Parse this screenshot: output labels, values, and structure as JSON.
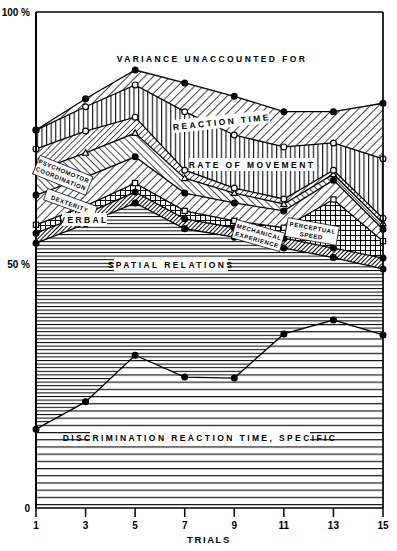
{
  "figure": {
    "x_axis_title": "TRIALS",
    "y_axis_top_label": "100 %",
    "y_axis_mid_label": "50 %",
    "y_axis_zero_label": "0",
    "x_tick_labels": [
      "1",
      "3",
      "5",
      "7",
      "9",
      "11",
      "13",
      "15"
    ]
  },
  "band_labels": {
    "variance_unaccounted": "VARIANCE    UNACCOUNTED    FOR",
    "reaction_time": "REACTION  TIME",
    "rate_of_movement": "RATE  OF  MOVEMENT",
    "psychomotor_coordination_line1": "PSYCHOMOTOR",
    "psychomotor_coordination_line2": "COORDINATION",
    "dexterity": "DEXTERITY",
    "verbal": "VERBAL",
    "spatial_relations": "SPATIAL   RELATIONS",
    "mechanical_line1": "MECHANICAL",
    "mechanical_line2": "EXPERIENCE",
    "perceptual_line1": "PERCEPTUAL",
    "perceptual_line2": "SPEED",
    "discrimination_reaction_time": "DISCRIMINATION   REACTION   TIME,   SPECIFIC"
  },
  "chart_data": {
    "type": "area",
    "title": "",
    "xlabel": "TRIALS",
    "ylabel": "",
    "xlim": [
      1,
      15
    ],
    "ylim": [
      0,
      100
    ],
    "grid": false,
    "legend_position": "inline-band-labels",
    "x": [
      1,
      3,
      5,
      7,
      9,
      11,
      13,
      15
    ],
    "stacking": "cumulative-from-bottom",
    "note": "Values are cumulative percent boundary lines read off the y axis (0-100%). Each band is the gap between consecutive boundary curves.",
    "boundaries": [
      {
        "name": "DISCRIMINATION REACTION TIME, SPECIFIC",
        "marker": "filled-circle",
        "cumulative_percent": [
          15.9,
          21.4,
          30.8,
          26.4,
          26.2,
          35.1,
          37.9,
          34.9
        ]
      },
      {
        "name": "SPATIAL RELATIONS",
        "marker": "filled-circle",
        "cumulative_percent": [
          53.4,
          57.3,
          61.5,
          56.3,
          54.6,
          52.4,
          50.5,
          48.2
        ]
      },
      {
        "name": "MECHANICAL EXPERIENCE",
        "marker": "filled-circle",
        "cumulative_percent": [
          55.4,
          59.3,
          63.7,
          58.3,
          56.5,
          54.4,
          52.4,
          50.4
        ]
      },
      {
        "name": "PERCEPTUAL SPEED",
        "marker": "open-square",
        "cumulative_percent": [
          57.1,
          60.9,
          65.5,
          59.9,
          57.9,
          56.5,
          62.2,
          53.8
        ]
      },
      {
        "name": "VERBAL",
        "marker": "filled-circle",
        "cumulative_percent": [
          63.1,
          66.7,
          70.8,
          63.5,
          61.5,
          59.9,
          66.1,
          56.2
        ]
      },
      {
        "name": "DEXTERITY",
        "marker": "open-triangle",
        "cumulative_percent": [
          67.9,
          71.6,
          75.6,
          66.5,
          63.5,
          61.3,
          67.3,
          57.4
        ]
      },
      {
        "name": "PSYCHOMOTOR COORDINATION",
        "marker": "open-circle",
        "cumulative_percent": [
          72.4,
          76.0,
          78.8,
          68.1,
          64.5,
          62.3,
          68.1,
          58.4
        ]
      },
      {
        "name": "RATE OF MOVEMENT",
        "marker": "open-circle",
        "cumulative_percent": [
          76.2,
          80.9,
          85.3,
          79.9,
          75.2,
          72.8,
          73.6,
          70.4
        ]
      },
      {
        "name": "REACTION TIME",
        "marker": "filled-circle",
        "cumulative_percent": [
          76.2,
          82.5,
          88.3,
          85.7,
          83.0,
          79.9,
          79.9,
          81.6
        ]
      }
    ],
    "bands_bottom_to_top": [
      "DISCRIMINATION REACTION TIME, SPECIFIC",
      "SPATIAL RELATIONS",
      "MECHANICAL EXPERIENCE",
      "PERCEPTUAL SPEED",
      "VERBAL",
      "DEXTERITY",
      "PSYCHOMOTOR COORDINATION",
      "RATE OF MOVEMENT",
      "REACTION TIME",
      "VARIANCE UNACCOUNTED FOR"
    ]
  },
  "colors": {
    "ink": "#000000",
    "paper": "#ffffff"
  }
}
